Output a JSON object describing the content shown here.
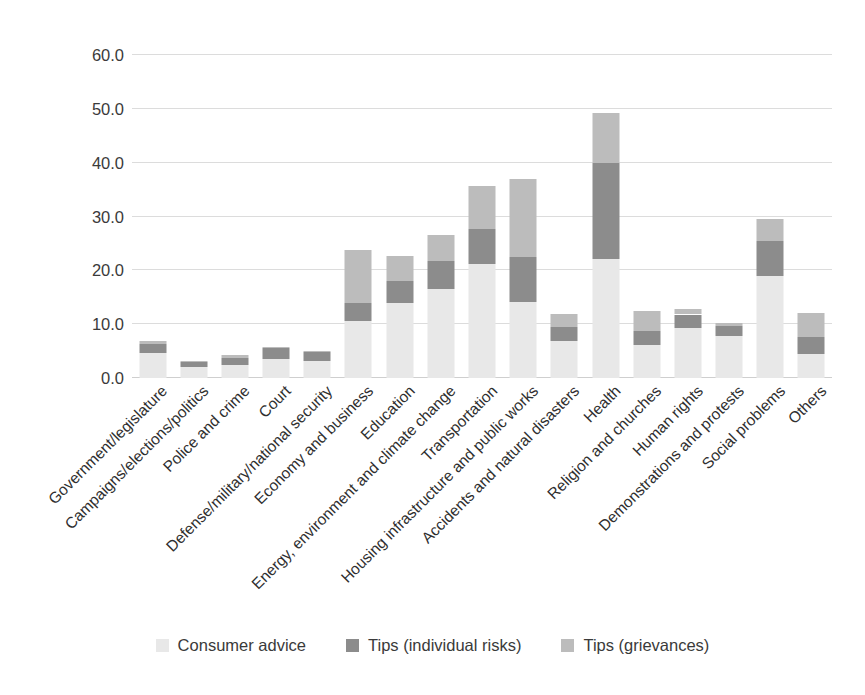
{
  "chart_data": {
    "type": "bar",
    "stacked": true,
    "title": "",
    "subtitle": "",
    "xlabel": "",
    "ylabel": "",
    "ylim": [
      0,
      60
    ],
    "yticks": [
      "0.0",
      "10.0",
      "20.0",
      "30.0",
      "40.0",
      "50.0",
      "60.0"
    ],
    "ytick_values": [
      0,
      10,
      20,
      30,
      40,
      50,
      60
    ],
    "grid": true,
    "legend_position": "bottom",
    "categories": [
      "Government/legislature",
      "Campaigns/elections/politics",
      "Police and crime",
      "Court",
      "Defense/military/national security",
      "Economy and business",
      "Education",
      "Energy, environment and climate change",
      "Transportation",
      "Housing infrastructure and public works",
      "Accidents and natural disasters",
      "Health",
      "Religion and churches",
      "Human rights",
      "Demonstrations and protests",
      "Social problems",
      "Others"
    ],
    "series": [
      {
        "name": "Consumer advice",
        "color": "#e8e8e8",
        "values": [
          4.6,
          2.1,
          2.4,
          3.6,
          3.2,
          10.5,
          14.0,
          16.6,
          21.2,
          14.2,
          6.8,
          22.2,
          6.2,
          9.2,
          7.8,
          19.0,
          4.4
        ]
      },
      {
        "name": "Tips (individual risks)",
        "color": "#8c8c8c",
        "values": [
          1.7,
          0.9,
          1.3,
          1.9,
          1.7,
          3.5,
          4.0,
          5.2,
          6.5,
          8.3,
          2.7,
          17.8,
          2.6,
          2.6,
          1.8,
          6.5,
          3.3
        ]
      },
      {
        "name": "Tips (grievances)",
        "color": "#bcbcbc",
        "values": [
          0.6,
          0.2,
          0.6,
          0.3,
          0.2,
          9.7,
          4.6,
          4.7,
          8.0,
          14.5,
          2.3,
          9.3,
          3.6,
          1.1,
          0.6,
          4.0,
          4.4
        ]
      }
    ],
    "totals": [
      6.9,
      3.2,
      4.3,
      5.8,
      5.1,
      23.7,
      22.6,
      26.5,
      35.7,
      37.0,
      11.8,
      49.3,
      12.4,
      12.9,
      10.2,
      29.5,
      12.1
    ]
  },
  "legend": {
    "items": [
      {
        "label": "Consumer advice",
        "color": "#e8e8e8"
      },
      {
        "label": "Tips (individual risks)",
        "color": "#8c8c8c"
      },
      {
        "label": "Tips (grievances)",
        "color": "#bcbcbc"
      }
    ]
  },
  "colors": {
    "background": "#ffffff",
    "gridline": "#dcdcdc",
    "text": "#3a3a3a"
  }
}
